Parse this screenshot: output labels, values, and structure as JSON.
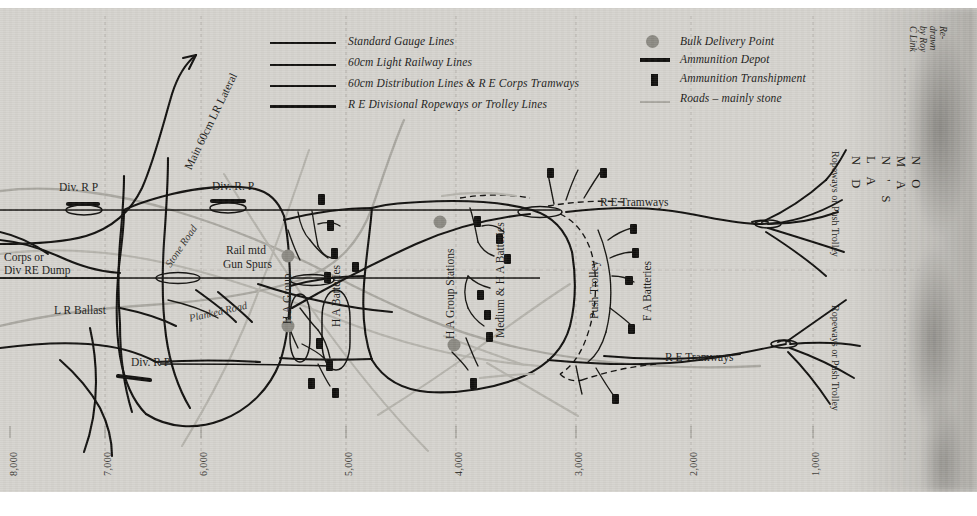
{
  "credit": "Re-drawn by Roy C Link",
  "no_mans_land": "N O   M A N ' S   L A N D",
  "colors": {
    "paper": "#d5d3ce",
    "ink": "#100f0d",
    "road": "#a9a7a0",
    "bulk_delivery": "#8b8982",
    "grid": "#8f8d86"
  },
  "legend": {
    "left": [
      {
        "label": "Standard Gauge Lines",
        "symbol": "line-thin",
        "color": "#100f0d"
      },
      {
        "label": "60cm Light Railway Lines",
        "symbol": "line-medium",
        "color": "#100f0d"
      },
      {
        "label": "60cm Distribution Lines & R E Corps Tramways",
        "symbol": "line-thin2",
        "color": "#100f0d"
      },
      {
        "label": "R E Divisional Ropeways or Trolley Lines",
        "symbol": "line-thick",
        "color": "#100f0d"
      }
    ],
    "right": [
      {
        "label": "Bulk Delivery Point",
        "symbol": "circle",
        "color": "#8b8982"
      },
      {
        "label": "Ammunition Depot",
        "symbol": "thick-bar",
        "color": "#100f0d"
      },
      {
        "label": "Ammunition Transhipment",
        "symbol": "small-rect",
        "color": "#100f0d"
      },
      {
        "label": "Roads – mainly stone",
        "symbol": "grey-line",
        "color": "#a9a7a0"
      }
    ]
  },
  "axis": {
    "label": "Distance in yards from the front line",
    "ticks": [
      "8,000",
      "7,000",
      "6,000",
      "5,000",
      "4,000",
      "3,000",
      "2,000",
      "1,000"
    ],
    "tick_x": [
      10,
      104,
      200,
      345,
      455,
      575,
      690,
      812
    ]
  },
  "map_labels": [
    {
      "text": "Main 60cm LR Lateral",
      "kind": "diagonal-rot"
    },
    {
      "text": "Div. R P",
      "kind": "horizontal"
    },
    {
      "text": "Div. R. P.",
      "kind": "horizontal"
    },
    {
      "text": "Div. R P",
      "kind": "horizontal"
    },
    {
      "text": "Corps or",
      "kind": "horizontal"
    },
    {
      "text": "Div RE Dump",
      "kind": "horizontal"
    },
    {
      "text": "L R Ballast",
      "kind": "horizontal"
    },
    {
      "text": "Stone Road",
      "kind": "road-diagonal"
    },
    {
      "text": "Planked Road",
      "kind": "road-diagonal"
    },
    {
      "text": "Rail mtd",
      "kind": "horizontal"
    },
    {
      "text": "Gun Spurs",
      "kind": "horizontal"
    },
    {
      "text": "H A Group",
      "kind": "rotated"
    },
    {
      "text": "H A Batteries",
      "kind": "rotated"
    },
    {
      "text": "H A Group Stations",
      "kind": "rotated"
    },
    {
      "text": "Medium & H A Batteries",
      "kind": "rotated"
    },
    {
      "text": "Push Trolley",
      "kind": "rotated"
    },
    {
      "text": "F A Batteries",
      "kind": "rotated"
    },
    {
      "text": "R E Tramways",
      "kind": "horizontal"
    },
    {
      "text": "R E Tramways",
      "kind": "horizontal"
    },
    {
      "text": "Ropeways or Push Trolley",
      "kind": "rotated-right"
    },
    {
      "text": "Ropeways or Push Trolley",
      "kind": "rotated-right"
    }
  ],
  "labels": {
    "main_lateral": "Main 60cm LR Lateral",
    "div_rp_1": "Div. R P",
    "div_rp_2": "Div. R. P.",
    "div_rp_3": "Div. R P",
    "corps_dump_1": "Corps or",
    "corps_dump_2": "Div RE Dump",
    "lr_ballast": "L R Ballast",
    "stone_road": "Stone Road",
    "planked_road": "Planked Road",
    "rail_gun_1": "Rail mtd",
    "rail_gun_2": "Gun Spurs",
    "ha_group": "H A Group",
    "ha_batteries": "H A Batteries",
    "ha_group_stations": "H A Group Stations",
    "medium_ha": "Medium & H A Batteries",
    "push_trolley": "Push Trolley",
    "fa_batteries": "F A Batteries",
    "re_tramways_upper": "R E Tramways",
    "re_tramways_lower": "R E Tramways",
    "ropeways_upper": "Ropeways or Push Trolley",
    "ropeways_lower": "Ropeways or Push Trolley"
  }
}
